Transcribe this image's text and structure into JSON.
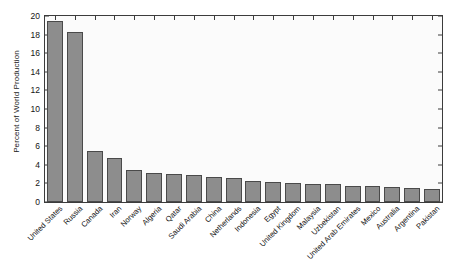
{
  "chart_data": {
    "type": "bar",
    "title": "",
    "xlabel": "",
    "ylabel": "Percent of World Production",
    "ylim": [
      0,
      20
    ],
    "yticks": [
      0,
      2,
      4,
      6,
      8,
      10,
      12,
      14,
      16,
      18,
      20
    ],
    "ytick_labels": [
      "0",
      "2",
      "4",
      "6",
      "8",
      "10",
      "12",
      "14",
      "16",
      "18",
      "20"
    ],
    "grid": false,
    "legend": null,
    "bar_color": "#8d8d8d",
    "bar_edge_color": "#4a4a4a",
    "axes_background": "#fbfbfb",
    "categories": [
      "United States",
      "Russia",
      "Canada",
      "Iran",
      "Norway",
      "Algeria",
      "Qatar",
      "Saudi Arabia",
      "China",
      "Netherlands",
      "Indonesia",
      "Egypt",
      "United Kingdom",
      "Malaysia",
      "Uzbekistan",
      "United Arab Emirates",
      "Mexico",
      "Australia",
      "Argentina",
      "Pakistan"
    ],
    "values": [
      19.5,
      18.3,
      5.5,
      4.75,
      3.4,
      3.1,
      3.05,
      2.9,
      2.7,
      2.6,
      2.3,
      2.2,
      2.0,
      1.95,
      1.9,
      1.75,
      1.7,
      1.6,
      1.55,
      1.4
    ]
  }
}
